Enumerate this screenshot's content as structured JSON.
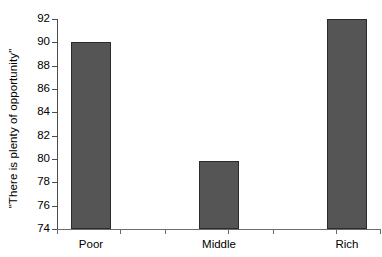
{
  "chart_data": {
    "type": "bar",
    "title": "",
    "subtitle": "",
    "xlabel": "",
    "ylabel": "\"There is plenty of opportunity\"",
    "categories": [
      "Poor",
      "Middle",
      "Rich"
    ],
    "values": [
      90.0,
      79.8,
      92.0
    ],
    "series": [
      {
        "name": "\"There is plenty of opportunity\"",
        "values": [
          90.0,
          79.8,
          92.0
        ]
      }
    ],
    "ylim": [
      74,
      92
    ],
    "yticks": [
      74,
      76,
      78,
      80,
      82,
      84,
      86,
      88,
      90,
      92
    ],
    "ytick_labels": [
      "74",
      "76",
      "78",
      "80",
      "82",
      "84",
      "86",
      "88",
      "90",
      "92"
    ],
    "xtick_count": 5,
    "grid": false,
    "legend": false,
    "legend_position": "none",
    "bar_color": "#555555",
    "bar_edge_color": "#2b2b2b",
    "axis_color": "#4d4d4d",
    "background_color": "#ffffff"
  }
}
